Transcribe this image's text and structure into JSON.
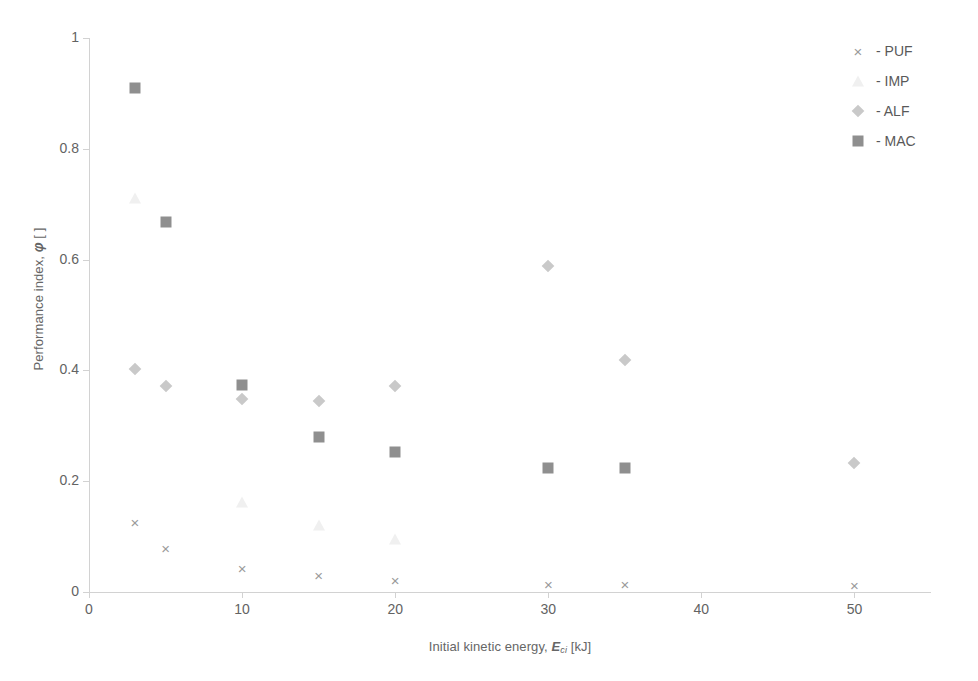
{
  "chart_data": {
    "type": "scatter",
    "title": "",
    "xlabel": "Initial kinetic energy, E_ci [kJ]",
    "ylabel": "Performance index, φ [ ]",
    "xlim": [
      0,
      55
    ],
    "ylim": [
      0,
      1
    ],
    "grid": false,
    "legend_position": "top-right",
    "series": [
      {
        "name": "PUF",
        "marker": "cross",
        "color": "#9a9a9a",
        "x": [
          3,
          5,
          10,
          15,
          20,
          30,
          35,
          50
        ],
        "y": [
          0.127,
          0.079,
          0.044,
          0.031,
          0.021,
          0.014,
          0.014,
          0.013
        ]
      },
      {
        "name": "IMP",
        "marker": "triangle",
        "color": "#f0f0f0",
        "x": [
          3,
          10,
          15,
          20
        ],
        "y": [
          0.712,
          0.162,
          0.121,
          0.095
        ]
      },
      {
        "name": "ALF",
        "marker": "diamond",
        "color": "#c9c9c9",
        "x": [
          3,
          5,
          10,
          15,
          20,
          30,
          35,
          50
        ],
        "y": [
          0.402,
          0.372,
          0.348,
          0.345,
          0.371,
          0.589,
          0.418,
          0.232
        ]
      },
      {
        "name": "MAC",
        "marker": "square",
        "color": "#8f8f8f",
        "x": [
          3,
          5,
          10,
          15,
          20,
          30,
          35
        ],
        "y": [
          0.91,
          0.668,
          0.373,
          0.279,
          0.253,
          0.223,
          0.223
        ]
      }
    ]
  },
  "axes": {
    "y": {
      "title_prefix": "Performance index, ",
      "title_symbol": "φ",
      "title_suffix": " [ ]",
      "ticks": [
        "0",
        "0.2",
        "0.4",
        "0.6",
        "0.8",
        "1"
      ],
      "tick_values": [
        0,
        0.2,
        0.4,
        0.6,
        0.8,
        1
      ]
    },
    "x": {
      "title_prefix": "Initial kinetic energy, ",
      "title_symbol": "E",
      "title_subscript": "ci",
      "title_suffix": " [kJ]",
      "ticks": [
        "0",
        "10",
        "20",
        "30",
        "40",
        "50"
      ],
      "tick_values": [
        0,
        10,
        20,
        30,
        40,
        50
      ]
    }
  },
  "legend": {
    "items": [
      {
        "label": "- PUF",
        "marker": "cross-marker"
      },
      {
        "label": "- IMP",
        "marker": "triangle-marker"
      },
      {
        "label": "- ALF",
        "marker": "diamond-marker"
      },
      {
        "label": "- MAC",
        "marker": "square-marker"
      }
    ]
  },
  "glyphs": {
    "cross": "×"
  }
}
